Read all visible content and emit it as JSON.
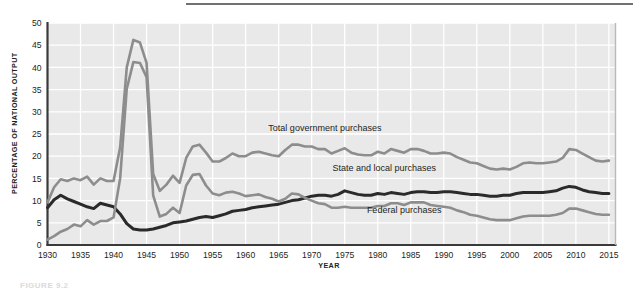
{
  "figure": {
    "caption": "FIGURE 9.2",
    "top_rule_color": "#6f7175"
  },
  "chart_data": {
    "type": "line",
    "title": "",
    "subtitle": "",
    "xlabel": "YEAR",
    "ylabel": "PERCENTAGE OF NATIONAL OUTPUT",
    "xlim": [
      1930,
      2016
    ],
    "ylim": [
      0,
      50
    ],
    "xticks": [
      1930,
      1935,
      1940,
      1945,
      1950,
      1955,
      1960,
      1965,
      1970,
      1975,
      1980,
      1985,
      1990,
      1995,
      2000,
      2005,
      2010,
      2015
    ],
    "yticks": [
      0,
      5,
      10,
      15,
      20,
      25,
      30,
      35,
      40,
      45,
      50
    ],
    "grid": true,
    "grid_color": "#ffffff",
    "plot_background": "#e9e9e9",
    "legend_position": "inline-annotations",
    "x": [
      1930,
      1931,
      1932,
      1933,
      1934,
      1935,
      1936,
      1937,
      1938,
      1939,
      1940,
      1941,
      1942,
      1943,
      1944,
      1945,
      1946,
      1947,
      1948,
      1949,
      1950,
      1951,
      1952,
      1953,
      1954,
      1955,
      1956,
      1957,
      1958,
      1959,
      1960,
      1961,
      1962,
      1963,
      1964,
      1965,
      1966,
      1967,
      1968,
      1969,
      1970,
      1971,
      1972,
      1973,
      1974,
      1975,
      1976,
      1977,
      1978,
      1979,
      1980,
      1981,
      1982,
      1983,
      1984,
      1985,
      1986,
      1987,
      1988,
      1989,
      1990,
      1991,
      1992,
      1993,
      1994,
      1995,
      1996,
      1997,
      1998,
      1999,
      2000,
      2001,
      2002,
      2003,
      2004,
      2005,
      2006,
      2007,
      2008,
      2009,
      2010,
      2011,
      2012,
      2013,
      2014,
      2015
    ],
    "series": [
      {
        "name": "Total government purchases",
        "color": "#8d8d8d",
        "width": 2.6,
        "label_x": 1972,
        "label_y": 25.6,
        "values": [
          9.6,
          13.0,
          14.8,
          14.4,
          15.0,
          14.6,
          15.4,
          13.6,
          15.0,
          14.4,
          14.4,
          22.0,
          40.0,
          46.2,
          45.6,
          41.0,
          16.0,
          12.2,
          13.6,
          15.6,
          14.0,
          19.6,
          22.2,
          22.6,
          20.8,
          18.8,
          18.8,
          19.6,
          20.6,
          20.0,
          20.0,
          20.8,
          21.0,
          20.6,
          20.2,
          20.0,
          21.4,
          22.6,
          22.6,
          22.2,
          22.2,
          21.6,
          21.6,
          20.6,
          21.2,
          21.8,
          20.8,
          20.4,
          20.2,
          20.2,
          21.0,
          20.6,
          21.6,
          21.2,
          20.8,
          21.6,
          21.6,
          21.2,
          20.6,
          20.6,
          20.8,
          20.6,
          19.8,
          19.2,
          18.6,
          18.4,
          17.8,
          17.2,
          17.0,
          17.2,
          17.0,
          17.6,
          18.4,
          18.6,
          18.4,
          18.4,
          18.6,
          18.8,
          19.6,
          21.6,
          21.4,
          20.6,
          19.8,
          19.0,
          18.8,
          19.0
        ]
      },
      {
        "name": "State and local purchases",
        "color": "#2a2a2a",
        "width": 3.0,
        "label_x": 1981,
        "label_y": 16.6,
        "values": [
          8.4,
          10.2,
          11.2,
          10.4,
          9.8,
          9.2,
          8.6,
          8.2,
          9.4,
          9.0,
          8.6,
          7.0,
          4.8,
          3.6,
          3.4,
          3.4,
          3.6,
          4.0,
          4.4,
          5.0,
          5.2,
          5.4,
          5.8,
          6.2,
          6.4,
          6.2,
          6.6,
          7.0,
          7.6,
          7.8,
          8.0,
          8.4,
          8.6,
          8.8,
          9.0,
          9.2,
          9.6,
          10.0,
          10.2,
          10.6,
          11.0,
          11.2,
          11.2,
          11.0,
          11.4,
          12.2,
          11.8,
          11.4,
          11.2,
          11.2,
          11.6,
          11.4,
          11.8,
          11.6,
          11.4,
          11.8,
          12.0,
          12.0,
          11.8,
          11.8,
          12.0,
          12.0,
          11.8,
          11.6,
          11.4,
          11.4,
          11.2,
          11.0,
          11.0,
          11.2,
          11.2,
          11.6,
          11.8,
          11.8,
          11.8,
          11.8,
          12.0,
          12.2,
          12.8,
          13.2,
          13.0,
          12.4,
          12.0,
          11.8,
          11.6,
          11.6
        ]
      },
      {
        "name": "Federal purchases",
        "color": "#8d8d8d",
        "width": 2.6,
        "label_x": 1984,
        "label_y": 7.2,
        "values": [
          1.2,
          2.0,
          3.0,
          3.6,
          4.6,
          4.2,
          5.6,
          4.6,
          5.4,
          5.4,
          6.2,
          15.0,
          35.2,
          41.2,
          41.0,
          37.8,
          11.2,
          6.4,
          7.0,
          8.4,
          7.2,
          13.4,
          15.8,
          16.0,
          13.4,
          11.6,
          11.2,
          11.8,
          12.0,
          11.6,
          11.0,
          11.2,
          11.4,
          10.8,
          10.4,
          9.8,
          10.4,
          11.6,
          11.4,
          10.6,
          10.0,
          9.4,
          9.2,
          8.4,
          8.4,
          8.6,
          8.4,
          8.4,
          8.4,
          8.4,
          8.8,
          8.8,
          9.4,
          9.4,
          9.0,
          9.6,
          9.6,
          9.6,
          9.0,
          8.8,
          8.6,
          8.4,
          7.8,
          7.4,
          6.8,
          6.6,
          6.2,
          5.8,
          5.6,
          5.6,
          5.6,
          6.0,
          6.4,
          6.6,
          6.6,
          6.6,
          6.6,
          6.8,
          7.2,
          8.2,
          8.2,
          7.8,
          7.4,
          7.0,
          6.8,
          6.8
        ]
      }
    ]
  }
}
